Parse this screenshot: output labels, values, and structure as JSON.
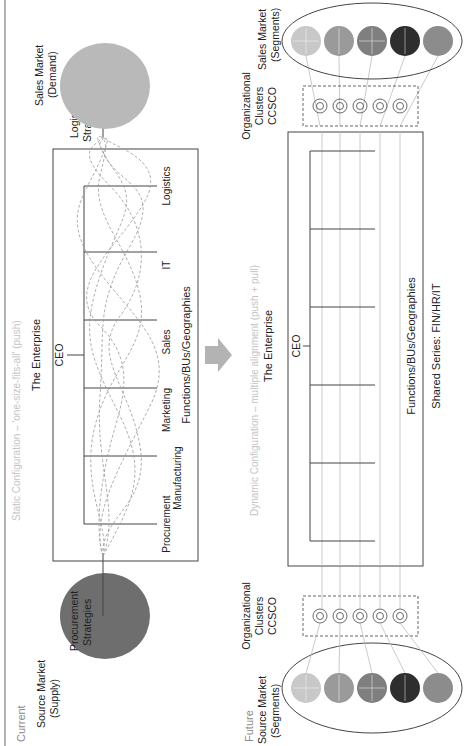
{
  "current": {
    "label": "Current",
    "subtitle": "Static Configuration – 'one-size-fits-all' (push)",
    "source_market": {
      "line1": "Source Market",
      "line2": "(Supply)"
    },
    "procurement_strategies": {
      "line1": "Procurement",
      "line2": "Strategies"
    },
    "enterprise_title": "The Enterprise",
    "ceo": "CEO",
    "functions": [
      "Procurement",
      "Manufacturing",
      "Marketing",
      "Sales",
      "IT",
      "Logistics"
    ],
    "functions_caption": "Functions/BUs/Geographies",
    "logistics_strategies": {
      "line1": "Logistics",
      "line2": "Strategies"
    },
    "sales_market": {
      "line1": "Sales Market",
      "line2": "(Demand)"
    }
  },
  "arrow": {
    "direction": "down",
    "color": "#b3b3b3"
  },
  "future": {
    "label": "Future",
    "subtitle": "Dynamic Configuration – multiple alignment (push + pull)",
    "source_market": {
      "line1": "Source Market",
      "line2": "(Segments)"
    },
    "org_clusters_left": {
      "line1": "Organizational",
      "line2": "Clusters",
      "line3": "CCSCO"
    },
    "enterprise_title": "The Enterprise",
    "ceo": "CEO",
    "functions_caption": "Functions/BUs/Geographies",
    "shared_series": "Shared Series: FIN/HR/IT",
    "org_clusters_right": {
      "line1": "Organizational",
      "line2": "Clusters",
      "line3": "CCSCO"
    },
    "sales_market": {
      "line1": "Sales Market",
      "line2": "(Segments)"
    },
    "segments": [
      {
        "labels": [
          "D",
          "P"
        ],
        "color": "#c8c8c8"
      },
      {
        "labels": [
          "a",
          "P"
        ],
        "color": "#9a9a9a"
      },
      {
        "labels": [
          "A",
          "P"
        ],
        "color": "#7f7f7f"
      },
      {
        "labels": [
          "A"
        ],
        "color": "#2e2e2e"
      },
      {
        "labels": [
          "I",
          "a"
        ],
        "color": "#8c8c8c"
      }
    ]
  },
  "colors": {
    "source_supply_ellipse": "#6e6e6e",
    "sales_demand_ellipse": "#b9b9b9",
    "line": "#444444",
    "dashed": "#9a9a9a",
    "faint_text": "#c4c4c4"
  }
}
